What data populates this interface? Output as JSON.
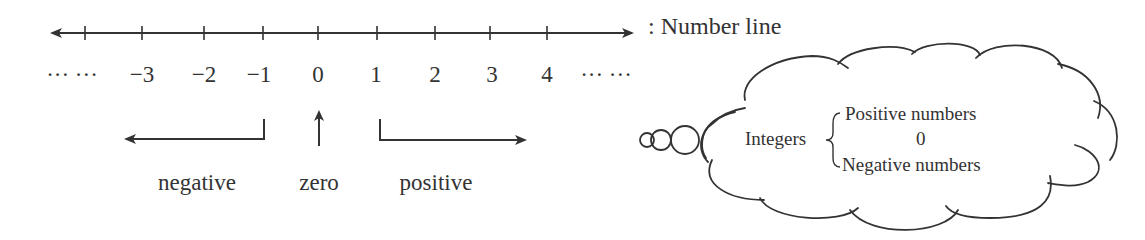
{
  "number_line": {
    "title": ":  Number line",
    "left_ellipsis": "··· ···",
    "right_ellipsis": "··· ···",
    "ticks": [
      {
        "label": "−3",
        "x": 142
      },
      {
        "label": "−2",
        "x": 204
      },
      {
        "label": "−1",
        "x": 263
      },
      {
        "label": "0",
        "x": 318
      },
      {
        "label": "1",
        "x": 377
      },
      {
        "label": "2",
        "x": 435
      },
      {
        "label": "3",
        "x": 490
      },
      {
        "label": "4",
        "x": 547
      }
    ]
  },
  "directions": {
    "negative": "negative",
    "zero": "zero",
    "positive": "positive"
  },
  "cloud": {
    "integers": "Integers",
    "items": [
      "Positive numbers",
      "0",
      "Negative numbers"
    ]
  },
  "colors": {
    "stroke": "#333333",
    "background": "#ffffff"
  }
}
